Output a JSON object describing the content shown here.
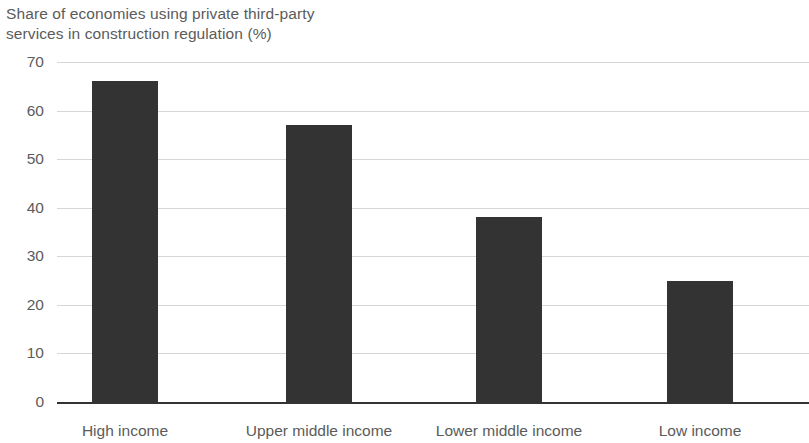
{
  "chart_data": {
    "type": "bar",
    "title": "Share of economies using private third-party\nservices in construction regulation (%)",
    "title_line_1": "Share of economies using private third-party",
    "title_line_2": "services in construction regulation (%)",
    "xlabel": "",
    "ylabel": "",
    "categories": [
      "High income",
      "Upper middle income",
      "Lower middle income",
      "Low income"
    ],
    "values": [
      66,
      57,
      38,
      25
    ],
    "ylim": [
      0,
      70
    ],
    "ytick_labels": [
      "0",
      "10",
      "20",
      "30",
      "40",
      "50",
      "60",
      "70"
    ],
    "ytick_values": [
      0,
      10,
      20,
      30,
      40,
      50,
      60,
      70
    ],
    "grid": true,
    "grid_axis": "y",
    "legend": false,
    "legend_position": "none",
    "bar_color": "#333333",
    "grid_color": "#d6d6d6",
    "axis_color": "#333333",
    "text_color": "#5b5b5b",
    "background_color": "#ffffff"
  }
}
